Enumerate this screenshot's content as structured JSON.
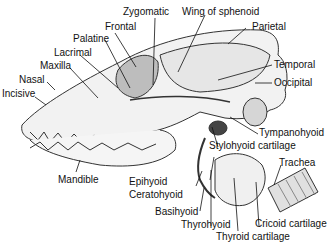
{
  "labels": {
    "zygomatic": "Zygomatic",
    "wing_of_sphenoid": "Wing of sphenoid",
    "frontal": "Frontal",
    "parietal": "Parietal",
    "palatine": "Palatine",
    "lacrimal": "Lacrimal",
    "maxilla": "Maxilla",
    "nasal": "Nasal",
    "incisive": "Incisive",
    "temporal": "Temporal",
    "occipital": "Occipital",
    "tympanohyoid": "Tympanohyoid",
    "stylohyoid_cartilage": "Stylohyoid cartilage",
    "trachea": "Trachea",
    "mandible": "Mandible",
    "epihyoid": "Epihyoid",
    "ceratohyoid": "Ceratohyoid",
    "basihyoid": "Basihyoid",
    "thyrohyoid": "Thyrohyoid",
    "thyroid_cartilage": "Thyroid cartilage",
    "cricoid_cartilage": "Cricoid cartilage"
  }
}
